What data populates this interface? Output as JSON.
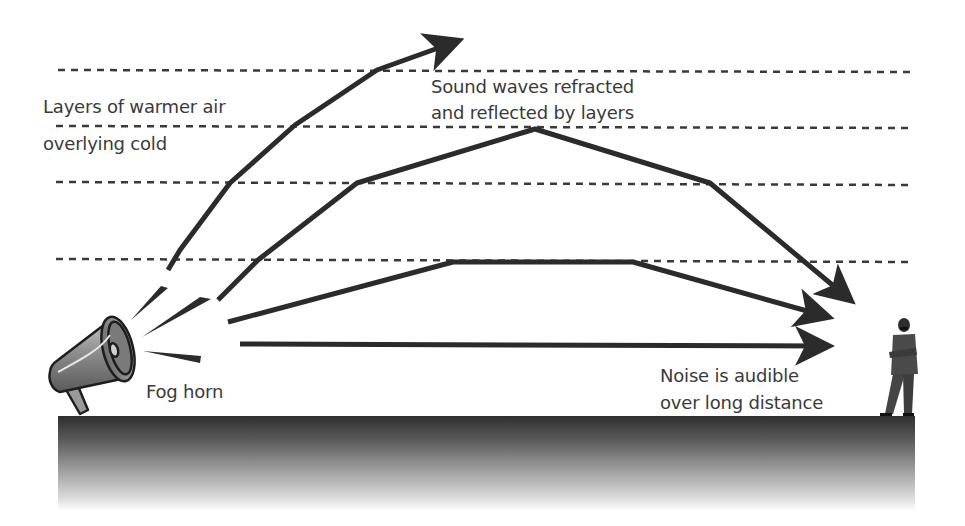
{
  "diagram": {
    "labels": {
      "warm_layers_line1": "Layers of warmer air",
      "warm_layers_line2": "overlying cold",
      "refraction_line1": "Sound waves refracted",
      "refraction_line2": "and reflected by layers",
      "source": "Fog horn",
      "result_line1": "Noise is audible",
      "result_line2": "over long distance"
    },
    "icons": {
      "source": "megaphone-icon",
      "listener": "person-figure"
    },
    "layer_count": 4,
    "arrow_count": 4,
    "colors": {
      "arrow": "#2b2b2b",
      "dashed_line": "#3a3a3a",
      "text": "#3a3a3a",
      "ground_top": "#2f2f2f",
      "ground_bottom": "#ffffff",
      "megaphone_body": "#8c8c8c"
    }
  }
}
